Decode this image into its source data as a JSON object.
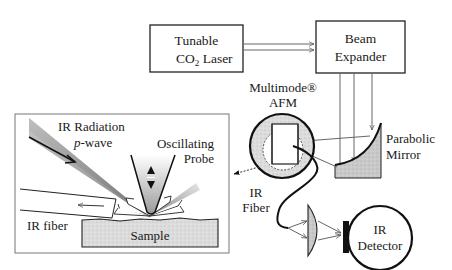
{
  "diagram": {
    "laser": {
      "line1": "Tunable",
      "line2_main": "CO",
      "line2_sub": "2",
      "line2_rest": " Laser"
    },
    "beam_expander": {
      "line1": "Beam",
      "line2": "Expander"
    },
    "afm": {
      "line1": "Multimode®",
      "line2": "AFM"
    },
    "mirror": {
      "line1": "Parabolic",
      "line2": "Mirror"
    },
    "fiber": {
      "line1": "IR",
      "line2": "Fiber"
    },
    "detector": {
      "line1": "IR",
      "line2": "Detector"
    },
    "inset": {
      "radiation": "IR Radiation",
      "pwave_italic": "p",
      "pwave_rest": "-wave",
      "probe_line1": "Oscillating",
      "probe_line2": "Probe",
      "ir_fiber": "IR fiber",
      "sample": "Sample"
    }
  }
}
